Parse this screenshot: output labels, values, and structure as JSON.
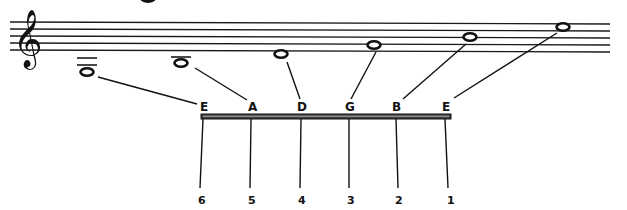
{
  "diagram": {
    "clef": {
      "name": "treble-clef",
      "glyph": "𝄞"
    },
    "strings": [
      {
        "string_number": "6",
        "note": "E",
        "staff_position": "two ledger lines below staff",
        "ledger_lines": 2
      },
      {
        "string_number": "5",
        "note": "A",
        "staff_position": "one ledger line below staff",
        "ledger_lines": 1
      },
      {
        "string_number": "4",
        "note": "D",
        "staff_position": "below bottom line",
        "ledger_lines": 0
      },
      {
        "string_number": "3",
        "note": "G",
        "staff_position": "second line",
        "ledger_lines": 0
      },
      {
        "string_number": "2",
        "note": "B",
        "staff_position": "third line",
        "ledger_lines": 0
      },
      {
        "string_number": "1",
        "note": "E",
        "staff_position": "top space",
        "ledger_lines": 0
      }
    ]
  }
}
